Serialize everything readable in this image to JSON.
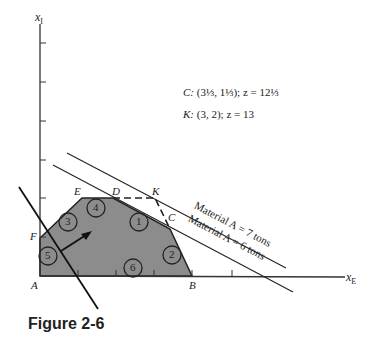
{
  "figure": {
    "caption": "Figure 2-6",
    "axes": {
      "x_label_main": "x",
      "x_label_sub": "E",
      "y_label_main": "x",
      "y_label_sub": "I"
    },
    "vertices": {
      "A": "A",
      "B": "B",
      "C": "C",
      "D": "D",
      "E": "E",
      "F": "F",
      "K": "K"
    },
    "constraint_labels": [
      "1",
      "2",
      "3",
      "4",
      "5",
      "6"
    ],
    "lines": {
      "material_7": "Material A = 7 tons",
      "material_6": "Material A = 6 tons"
    },
    "annotations": {
      "c_prefix": "C:",
      "c_coords": "(3⅓, 1⅓); z = 12⅓",
      "k_prefix": "K:",
      "k_coords": "(3, 2); z = 13"
    },
    "colors": {
      "feasible_region": "#8c8c8c",
      "line": "#222222"
    }
  }
}
